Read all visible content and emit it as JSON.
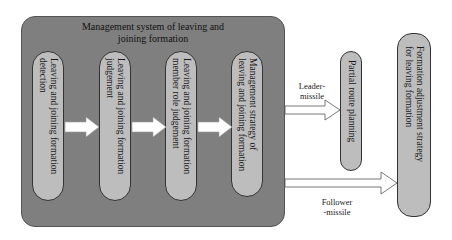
{
  "diagram": {
    "system": {
      "title_line1": "Management system of leaving and",
      "title_line2": "joining formation"
    },
    "modules": [
      {
        "label": "Leaving and joining formation\ndetection"
      },
      {
        "label": "Leaving and joining formation\njudgement"
      },
      {
        "label": "Leaving and joining formation\nmember role judgement"
      },
      {
        "label": "Management    strategy    of\nleaving and joining formation"
      }
    ],
    "outputs": {
      "partial_route": {
        "label": "Partial route planning"
      },
      "formation_adjustment": {
        "label": "Formation adjustment strategy\nfor leaving formation"
      }
    },
    "edges": {
      "leader": {
        "line1": "Leader-",
        "line2": "missile"
      },
      "follower": {
        "line1": "Follower",
        "line2": "-missile"
      }
    },
    "colors": {
      "outer_box": "#7f7f7f",
      "pill": "#bdbdbd",
      "arrow_fill": "#ffffff",
      "arrow_stroke": "#555555"
    }
  }
}
